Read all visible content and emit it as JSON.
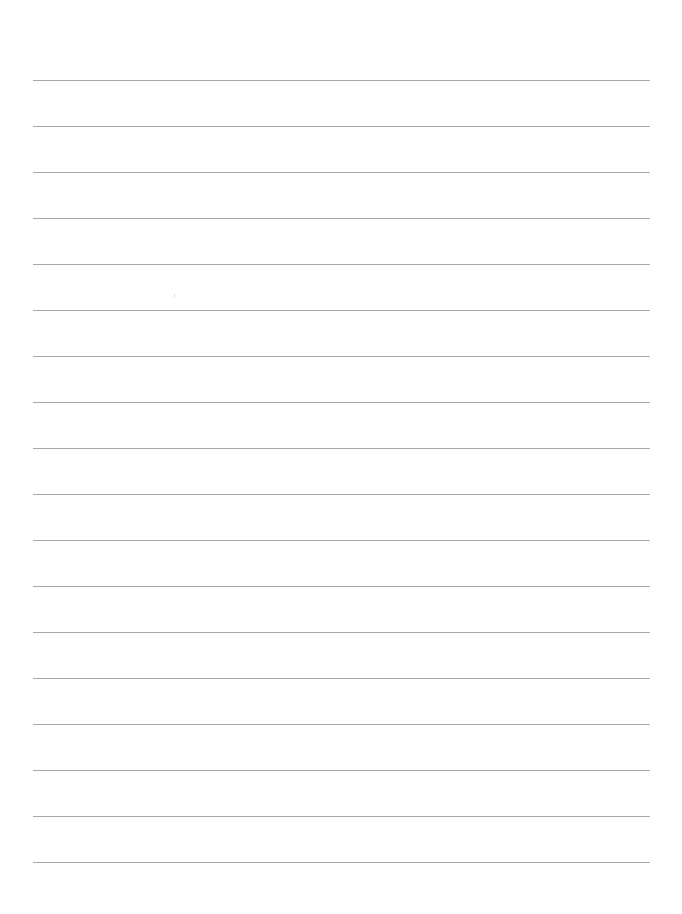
{
  "page": {
    "type": "lined-paper",
    "background_color": "#ffffff",
    "line_color": "#a8a8a8",
    "line_count": 18,
    "first_line_y": 80,
    "line_spacing": 46,
    "line_left": 33,
    "line_right": 650,
    "text_content": []
  }
}
